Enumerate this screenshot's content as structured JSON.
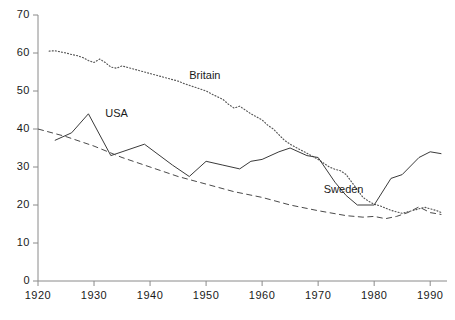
{
  "chart_data": {
    "type": "line",
    "title": "",
    "subtitle": "",
    "xlabel": "",
    "ylabel": "",
    "xlim": [
      1920,
      1993
    ],
    "ylim": [
      0,
      70
    ],
    "xticks": [
      1920,
      1930,
      1940,
      1950,
      1960,
      1970,
      1980,
      1990
    ],
    "yticks": [
      0,
      10,
      20,
      30,
      40,
      50,
      60,
      70
    ],
    "grid": false,
    "legend": "inline-annotations",
    "series": [
      {
        "name": "Britain",
        "style": "dotted",
        "color": "#555555",
        "label_x": 1947,
        "label_y": 54,
        "x": [
          1922,
          1923,
          1924,
          1925,
          1926,
          1927,
          1928,
          1929,
          1930,
          1931,
          1932,
          1933,
          1934,
          1935,
          1936,
          1937,
          1938,
          1939,
          1940,
          1941,
          1942,
          1943,
          1944,
          1945,
          1946,
          1947,
          1948,
          1949,
          1950,
          1951,
          1952,
          1953,
          1954,
          1955,
          1956,
          1957,
          1958,
          1959,
          1960,
          1961,
          1962,
          1963,
          1964,
          1965,
          1966,
          1967,
          1968,
          1969,
          1970,
          1971,
          1972,
          1973,
          1974,
          1975,
          1976,
          1977,
          1978,
          1979,
          1980,
          1981,
          1982,
          1983,
          1984,
          1985,
          1986,
          1987,
          1988,
          1989,
          1990,
          1991,
          1992
        ],
        "y": [
          60.5,
          60.6,
          60.3,
          60.0,
          59.6,
          59.3,
          58.8,
          58.0,
          57.5,
          58.4,
          57.5,
          56.3,
          56.0,
          56.6,
          56.2,
          55.8,
          55.4,
          55.0,
          54.6,
          54.2,
          53.8,
          53.4,
          53.0,
          52.6,
          52.0,
          51.5,
          51.0,
          50.5,
          50.0,
          49.2,
          48.5,
          47.8,
          46.5,
          45.5,
          46.0,
          45.0,
          44.0,
          43.2,
          42.4,
          41.0,
          40.0,
          38.5,
          37.0,
          36.0,
          35.2,
          34.4,
          33.6,
          32.8,
          32.0,
          31.0,
          30.0,
          29.4,
          29.0,
          28.0,
          26.0,
          24.0,
          22.0,
          21.0,
          20.2,
          19.8,
          19.2,
          18.6,
          18.2,
          17.8,
          18.2,
          18.6,
          19.0,
          19.4,
          19.0,
          18.6,
          18.0
        ]
      },
      {
        "name": "USA",
        "style": "solid",
        "color": "#3a3a3a",
        "label_x": 1932,
        "label_y": 44,
        "x": [
          1923,
          1926,
          1929,
          1933,
          1935,
          1939,
          1944,
          1947,
          1950,
          1953,
          1956,
          1958,
          1960,
          1963,
          1965,
          1968,
          1970,
          1973,
          1975,
          1977,
          1980,
          1983,
          1985,
          1988,
          1990,
          1992
        ],
        "y": [
          37.0,
          39.0,
          44.0,
          33.0,
          34.0,
          36.0,
          30.5,
          27.5,
          31.5,
          30.5,
          29.5,
          31.5,
          32.0,
          34.0,
          35.0,
          33.0,
          32.5,
          26.0,
          22.5,
          20.0,
          20.0,
          27.0,
          28.0,
          32.5,
          34.0,
          33.5
        ]
      },
      {
        "name": "Sweden",
        "style": "dashed",
        "color": "#4a4a4a",
        "label_x": 1971,
        "label_y": 24,
        "x": [
          1920,
          1925,
          1930,
          1935,
          1940,
          1945,
          1950,
          1955,
          1960,
          1965,
          1970,
          1975,
          1978,
          1980,
          1982,
          1984,
          1986,
          1988,
          1990,
          1992
        ],
        "y": [
          40.0,
          38.0,
          35.5,
          32.5,
          30.0,
          27.5,
          25.5,
          23.5,
          22.0,
          20.0,
          18.5,
          17.2,
          16.8,
          17.0,
          16.4,
          17.0,
          18.0,
          19.5,
          18.0,
          17.5
        ]
      }
    ]
  },
  "axes": {
    "x_tick_labels": [
      "1920",
      "1930",
      "1940",
      "1950",
      "1960",
      "1970",
      "1980",
      "1990"
    ],
    "y_tick_labels": [
      "0",
      "10",
      "20",
      "30",
      "40",
      "50",
      "60",
      "70"
    ]
  }
}
